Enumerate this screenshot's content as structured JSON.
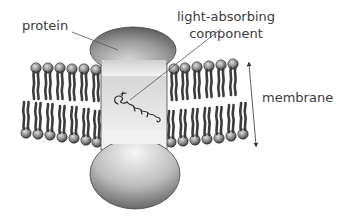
{
  "diagram": {
    "type": "membrane protein schematic",
    "labels": {
      "protein": "protein",
      "light_absorbing_line1": "light-absorbing",
      "light_absorbing_line2": "component",
      "membrane": "membrane"
    },
    "components": [
      {
        "id": "protein",
        "description": "transmembrane protein spanning the lipid bilayer, rounded caps above and below membrane"
      },
      {
        "id": "light-absorbing-component",
        "description": "small molecule embedded inside the protein within the membrane region"
      },
      {
        "id": "membrane",
        "description": "lipid bilayer, 7 lipids per leaflet on each side of the protein"
      },
      {
        "id": "membrane-thickness-arrow",
        "description": "double-headed arrow indicating membrane thickness"
      }
    ],
    "lipids_per_leaflet_each_side": 7,
    "colors": {
      "label_text": "#3a3a3a",
      "protein_light": "#f2f2f2",
      "protein_dark": "#6e6e6e",
      "lipid_tail": "#4a4a4a",
      "lipid_head": "#8a8a8a",
      "leader_line": "#555555"
    }
  }
}
